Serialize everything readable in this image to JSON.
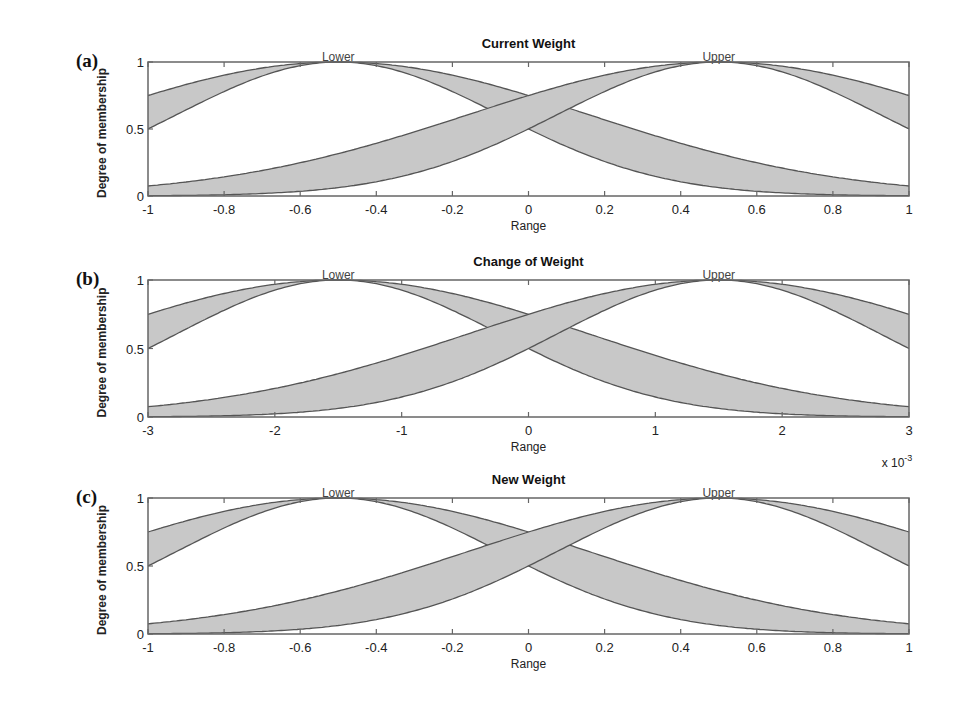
{
  "chart_data": [
    {
      "type": "area",
      "panel_label": "(a)",
      "title": "Current Weight",
      "xlabel": "Range",
      "ylabel": "Degree of membership",
      "xlim": [
        -1,
        1
      ],
      "ylim": [
        0,
        1
      ],
      "xticks": [
        -1,
        -0.8,
        -0.6,
        -0.4,
        -0.2,
        0,
        0.2,
        0.4,
        0.6,
        0.8,
        1
      ],
      "xtick_labels": [
        "-1",
        "-0.8",
        "-0.6",
        "-0.4",
        "-0.2",
        "0",
        "0.2",
        "0.4",
        "0.6",
        "0.8",
        "1"
      ],
      "yticks": [
        0,
        0.5,
        1
      ],
      "ytick_labels": [
        "0",
        "0.5",
        "1"
      ],
      "x_multiplier": "",
      "grid": false,
      "series": [
        {
          "name": "Lower",
          "kind": "interval type-2 gaussian",
          "center": -0.5,
          "sigma_upper": 0.659,
          "sigma_lower": 0.425,
          "value_at_range_min": {
            "upper": 0.75,
            "lower": 0.5
          }
        },
        {
          "name": "Upper",
          "kind": "interval type-2 gaussian",
          "center": 0.5,
          "sigma_upper": 0.659,
          "sigma_lower": 0.425,
          "value_at_range_max": {
            "upper": 0.75,
            "lower": 0.5
          }
        }
      ],
      "annotations": [
        "Lower",
        "Upper"
      ]
    },
    {
      "type": "area",
      "panel_label": "(b)",
      "title": "Change of Weight",
      "xlabel": "Range",
      "ylabel": "Degree of membership",
      "xlim": [
        -3,
        3
      ],
      "ylim": [
        0,
        1
      ],
      "xticks": [
        -3,
        -2,
        -1,
        0,
        1,
        2,
        3
      ],
      "xtick_labels": [
        "-3",
        "-2",
        "-1",
        "0",
        "1",
        "2",
        "3"
      ],
      "yticks": [
        0,
        0.5,
        1
      ],
      "ytick_labels": [
        "0",
        "0.5",
        "1"
      ],
      "x_multiplier": "x 10",
      "x_multiplier_exp": "-3",
      "grid": false,
      "series": [
        {
          "name": "Lower",
          "kind": "interval type-2 gaussian",
          "center": -1.5,
          "sigma_upper": 1.977,
          "sigma_lower": 1.274,
          "value_at_range_min": {
            "upper": 0.75,
            "lower": 0.5
          }
        },
        {
          "name": "Upper",
          "kind": "interval type-2 gaussian",
          "center": 1.5,
          "sigma_upper": 1.977,
          "sigma_lower": 1.274,
          "value_at_range_max": {
            "upper": 0.75,
            "lower": 0.5
          }
        }
      ],
      "annotations": [
        "Lower",
        "Upper"
      ]
    },
    {
      "type": "area",
      "panel_label": "(c)",
      "title": "New Weight",
      "xlabel": "Range",
      "ylabel": "Degree of membership",
      "xlim": [
        -1,
        1
      ],
      "ylim": [
        0,
        1
      ],
      "xticks": [
        -1,
        -0.8,
        -0.6,
        -0.4,
        -0.2,
        0,
        0.2,
        0.4,
        0.6,
        0.8,
        1
      ],
      "xtick_labels": [
        "-1",
        "-0.8",
        "-0.6",
        "-0.4",
        "-0.2",
        "0",
        "0.2",
        "0.4",
        "0.6",
        "0.8",
        "1"
      ],
      "yticks": [
        0,
        0.5,
        1
      ],
      "ytick_labels": [
        "0",
        "0.5",
        "1"
      ],
      "x_multiplier": "",
      "grid": false,
      "series": [
        {
          "name": "Lower",
          "kind": "interval type-2 gaussian",
          "center": -0.5,
          "sigma_upper": 0.659,
          "sigma_lower": 0.425,
          "value_at_range_min": {
            "upper": 0.75,
            "lower": 0.5
          }
        },
        {
          "name": "Upper",
          "kind": "interval type-2 gaussian",
          "center": 0.5,
          "sigma_upper": 0.659,
          "sigma_lower": 0.425,
          "value_at_range_max": {
            "upper": 0.75,
            "lower": 0.5
          }
        }
      ],
      "annotations": [
        "Lower",
        "Upper"
      ]
    }
  ],
  "style": {
    "fou_fill": "#c8c8c8",
    "curve_color": "#555555",
    "axes_color": "#666666",
    "text_color": "#111111"
  }
}
